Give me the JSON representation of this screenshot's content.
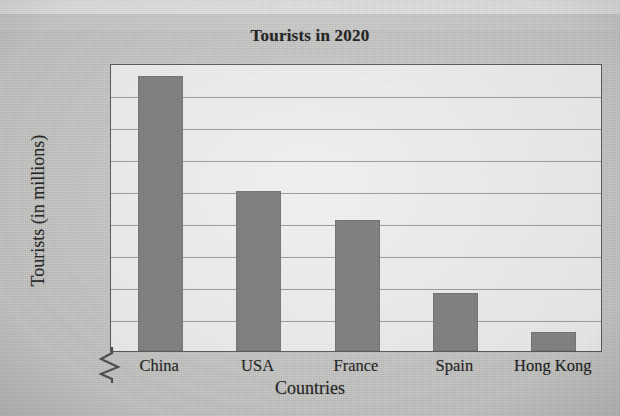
{
  "chart_data": {
    "type": "bar",
    "title": "Tourists in 2020",
    "xlabel": "Countries",
    "ylabel": "Tourists (in millions)",
    "categories": [
      "China",
      "USA",
      "France",
      "Spain",
      "Hong Kong"
    ],
    "values": [
      136,
      100,
      91,
      68,
      56
    ],
    "ylim": [
      50,
      140
    ],
    "ytick_step": 10,
    "yticks": [
      50,
      60,
      70,
      80,
      90,
      100,
      110,
      120,
      130,
      140
    ],
    "grid": true,
    "axis_break": true,
    "axis_break_note": "zigzag break below 50 on the vertical axis",
    "legend": null,
    "legend_position": "none",
    "bar_color": "#7e7e7e",
    "plot_background": "#f3f3f1",
    "page_background": "#c9c9c7",
    "gridline_color": "#8c8c8c",
    "axis_color": "#5a5a5a",
    "text_color": "#1f1f1f"
  }
}
